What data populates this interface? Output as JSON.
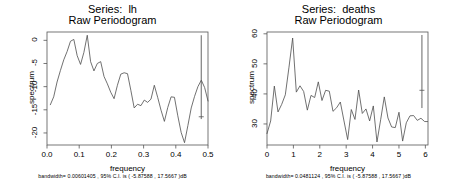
{
  "figure": {
    "background": "#ffffff",
    "line_color": "#4d4d4d",
    "axis_color": "#555555",
    "text_color": "#000000"
  },
  "panels": [
    {
      "id": "lh",
      "title_line1": "Series:  lh",
      "title_line2": "Raw Periodogram",
      "xlabel": "frequency",
      "ylabel": "spectrum",
      "caption": "bandwidth= 0.00601405 , 95% C.I. is ( -5.87588 , 17.5667 )dB",
      "chart_data": {
        "type": "line",
        "title": "Series:  lh  Raw Periodogram",
        "xlabel": "frequency",
        "ylabel": "spectrum",
        "xlim": [
          0.0,
          0.5
        ],
        "ylim": [
          -22.6,
          1.8
        ],
        "xticks": [
          0.0,
          0.1,
          0.2,
          0.3,
          0.4,
          0.5
        ],
        "xtick_labels": [
          "0.0",
          "0.1",
          "0.2",
          "0.3",
          "0.4",
          "0.5"
        ],
        "yticks": [
          0,
          -5,
          -10,
          -15,
          -20
        ],
        "ytick_labels": [
          "0",
          "-5",
          "-10",
          "-15",
          "-20"
        ],
        "grid": false,
        "legend": "none",
        "ci_bar": {
          "x": 0.479,
          "upper": 1.1,
          "lower": -17.0,
          "center": -16.5
        },
        "x": [
          0.0104,
          0.0208,
          0.0312,
          0.0417,
          0.0521,
          0.0625,
          0.0729,
          0.0833,
          0.0937,
          0.1042,
          0.1146,
          0.125,
          0.1354,
          0.1458,
          0.1562,
          0.1667,
          0.1771,
          0.1875,
          0.1979,
          0.2083,
          0.2187,
          0.2292,
          0.2396,
          0.25,
          0.2604,
          0.2708,
          0.2812,
          0.2917,
          0.3021,
          0.3125,
          0.3229,
          0.3333,
          0.3437,
          0.3542,
          0.3646,
          0.375,
          0.3854,
          0.3958,
          0.4062,
          0.4167,
          0.4271,
          0.4375,
          0.4479,
          0.4583,
          0.4687,
          0.4792,
          0.4896,
          0.5
        ],
        "y": [
          -13.9,
          -12.2,
          -9.0,
          -6.5,
          -4.2,
          -2.4,
          -0.2,
          0.2,
          -3.3,
          -5.2,
          -2.6,
          1.1,
          -4.6,
          -6.6,
          -5.0,
          -4.6,
          -7.8,
          -9.4,
          -11.2,
          -12.6,
          -9.7,
          -7.3,
          -7.0,
          -7.2,
          -10.8,
          -14.6,
          -13.8,
          -14.1,
          -12.9,
          -13.4,
          -12.7,
          -9.7,
          -12.3,
          -15.1,
          -17.5,
          -14.5,
          -12.2,
          -12.3,
          -16.3,
          -19.9,
          -22.1,
          -18.4,
          -14.6,
          -12.1,
          -10.0,
          -8.6,
          -10.2,
          -13.1
        ]
      }
    },
    {
      "id": "deaths",
      "title_line1": "Series:  deaths",
      "title_line2": "Raw Periodogram",
      "xlabel": "frequency",
      "ylabel": "spectrum",
      "caption": "bandwidth= 0.0481124 , 95% C.I. is ( -5.87588 , 17.5667 )dB",
      "chart_data": {
        "type": "line",
        "title": "Series:  deaths  Raw Periodogram",
        "xlabel": "frequency",
        "ylabel": "spectrum",
        "xlim": [
          0.0,
          6.1
        ],
        "ylim": [
          23.0,
          60.6
        ],
        "xticks": [
          0,
          1,
          2,
          3,
          4,
          5,
          6
        ],
        "xtick_labels": [
          "0",
          "1",
          "2",
          "3",
          "4",
          "5",
          "6"
        ],
        "yticks": [
          60,
          50,
          40,
          30
        ],
        "ytick_labels": [
          "60",
          "50",
          "40",
          "30"
        ],
        "grid": false,
        "legend": "none",
        "ci_bar": {
          "x": 5.87,
          "upper": 59.6,
          "lower": 35.3,
          "center": 41.2
        },
        "x": [
          0.0,
          0.139,
          0.278,
          0.417,
          0.556,
          0.694,
          0.833,
          0.972,
          1.111,
          1.25,
          1.389,
          1.528,
          1.667,
          1.806,
          1.944,
          2.083,
          2.222,
          2.361,
          2.5,
          2.639,
          2.778,
          2.917,
          3.056,
          3.194,
          3.333,
          3.472,
          3.611,
          3.75,
          3.889,
          4.028,
          4.167,
          4.306,
          4.444,
          4.583,
          4.722,
          4.861,
          5.0,
          5.139,
          5.278,
          5.417,
          5.556,
          5.694,
          5.833,
          5.972,
          6.083
        ],
        "y": [
          26.8,
          31.0,
          42.6,
          34.0,
          36.5,
          39.7,
          48.9,
          58.6,
          40.6,
          42.7,
          40.8,
          34.6,
          39.5,
          38.8,
          44.0,
          37.8,
          41.2,
          40.9,
          34.2,
          35.4,
          37.3,
          31.0,
          24.8,
          34.8,
          31.5,
          41.3,
          33.5,
          35.0,
          31.0,
          36.0,
          24.0,
          31.4,
          39.0,
          32.0,
          29.0,
          28.8,
          33.9,
          24.3,
          30.4,
          32.7,
          32.8,
          31.2,
          31.9,
          30.8,
          30.8
        ]
      }
    }
  ]
}
